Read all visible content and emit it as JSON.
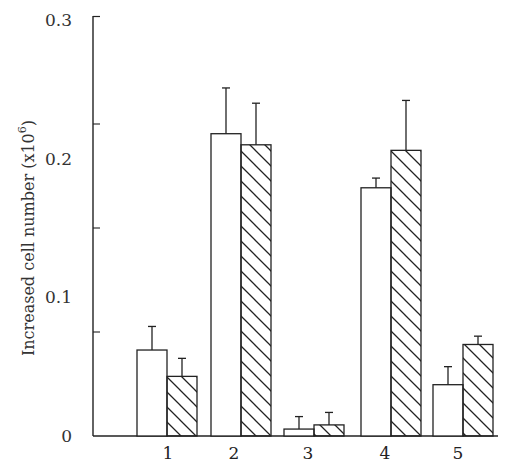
{
  "chart_data": {
    "type": "bar",
    "title": "",
    "xlabel": "",
    "ylabel": "Increased cell number (x10^6)",
    "ylabel_main": "Increased cell number (x10",
    "ylabel_exp": "6",
    "ylabel_close": ")",
    "ylim": [
      0,
      0.3
    ],
    "yticks": [
      "0",
      "0.1",
      "0.2",
      "0.3"
    ],
    "ytick_values": [
      0,
      0.1,
      0.2,
      0.3
    ],
    "minor_tick_values": [
      0.075,
      0.15,
      0.225
    ],
    "grid": false,
    "legend": null,
    "categories": [
      "1",
      "2",
      "3",
      "4",
      "5"
    ],
    "series": [
      {
        "name": "open",
        "fill": "white",
        "values": [
          0.062,
          0.218,
          0.005,
          0.179,
          0.037
        ],
        "error_upper": [
          0.017,
          0.033,
          0.009,
          0.007,
          0.013
        ]
      },
      {
        "name": "hatched",
        "fill": "hatched",
        "values": [
          0.043,
          0.21,
          0.008,
          0.206,
          0.066
        ],
        "error_upper": [
          0.013,
          0.03,
          0.009,
          0.036,
          0.006
        ]
      }
    ]
  },
  "colors": {
    "ink": "#222222",
    "background": "#ffffff"
  }
}
